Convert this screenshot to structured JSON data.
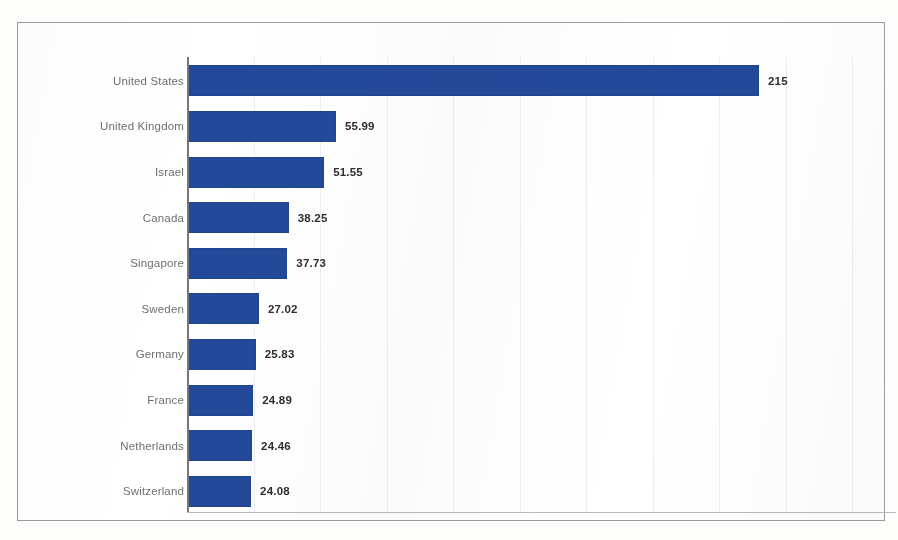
{
  "chart_data": {
    "type": "bar",
    "orientation": "horizontal",
    "title": "",
    "subtitle": "",
    "xlabel": "",
    "ylabel": "",
    "categories": [
      "United States",
      "United Kingdom",
      "Israel",
      "Canada",
      "Singapore",
      "Sweden",
      "Germany",
      "France",
      "Netherlands",
      "Switzerland"
    ],
    "values": [
      215,
      55.99,
      51.55,
      38.25,
      37.73,
      27.02,
      25.83,
      24.89,
      24.46,
      24.08
    ],
    "value_labels": [
      "215",
      "55.99",
      "51.55",
      "38.25",
      "37.73",
      "27.02",
      "25.83",
      "24.89",
      "24.46",
      "24.08"
    ],
    "xlim": [
      0,
      262
    ],
    "gridline_values": [
      25,
      50,
      75,
      100,
      125,
      150,
      175,
      200,
      225,
      250
    ],
    "grid": true,
    "tick_labels_visible": false,
    "legend": null,
    "legend_position": "none",
    "series": [
      {
        "name": "Value",
        "values": [
          215,
          55.99,
          51.55,
          38.25,
          37.73,
          27.02,
          25.83,
          24.89,
          24.46,
          24.08
        ]
      }
    ]
  },
  "style": {
    "bar_color": "#234A9A",
    "value_label_color": "#2e2e2e",
    "category_label_color": "#6f6f6f",
    "gridline_color": "#eceff3",
    "axis_color": "#767676",
    "frame_color": "#9a9a9a",
    "background": "#ffffff"
  }
}
